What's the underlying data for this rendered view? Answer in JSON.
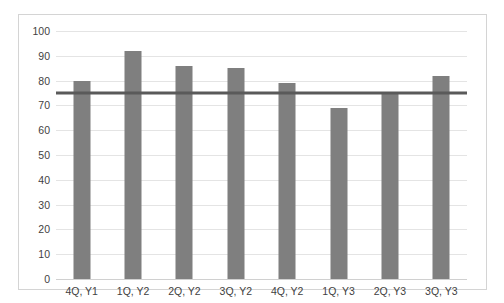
{
  "chart_data": {
    "type": "bar",
    "title": "",
    "subtitle": "",
    "xlabel": "",
    "ylabel": "",
    "categories": [
      "4Q, Y1",
      "1Q, Y2",
      "2Q, Y2",
      "3Q, Y2",
      "4Q, Y2",
      "1Q, Y3",
      "2Q, Y3",
      "3Q, Y3"
    ],
    "values": [
      80,
      92,
      86,
      85,
      79,
      69,
      75,
      82
    ],
    "ylim": [
      0,
      100
    ],
    "ytick_step": 10,
    "ytick_labels": [
      "0",
      "10",
      "20",
      "30",
      "40",
      "50",
      "60",
      "70",
      "80",
      "90",
      "100"
    ],
    "ytick_values": [
      0,
      10,
      20,
      30,
      40,
      50,
      60,
      70,
      80,
      90,
      100
    ],
    "grid": true,
    "legend": false,
    "legend_position": "none",
    "annotations": [
      {
        "name": "reference-line",
        "type": "hline",
        "value": 75,
        "label": ""
      }
    ],
    "series": [
      {
        "name": "",
        "values": [
          80,
          92,
          86,
          85,
          79,
          69,
          75,
          82
        ],
        "color": "#7f7f7f"
      }
    ],
    "colors": {
      "bar": "#7f7f7f",
      "reference_line": "#5a5a5a",
      "gridline": "#e4e4e4",
      "border": "#d4d4d4",
      "tick_text": "#3f3f3f",
      "background": "#ffffff"
    }
  }
}
